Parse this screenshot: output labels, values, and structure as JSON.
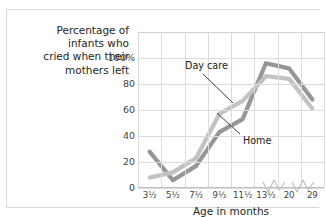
{
  "chart_data": {
    "type": "line",
    "title": "Percentage of infants who cried when their mothers left",
    "title_lines": [
      "Percentage of",
      "infants who",
      "cried when their",
      "mothers left"
    ],
    "xlabel": "Age in months",
    "ylabel": "",
    "categories": [
      "3½",
      "5½",
      "7½",
      "9½",
      "11½",
      "13½",
      "20",
      "29"
    ],
    "ytick_labels": [
      "0",
      "20",
      "40",
      "60",
      "80",
      "100%"
    ],
    "yticks": [
      0,
      20,
      40,
      60,
      80,
      100
    ],
    "ylim": [
      0,
      120
    ],
    "grid": true,
    "legend_position": "inline-annotations",
    "axis_breaks": [
      "after 13½",
      "after 20"
    ],
    "series": [
      {
        "name": "Home",
        "color": "#969696",
        "values": [
          28,
          6,
          17,
          43,
          53,
          96,
          92,
          68
        ]
      },
      {
        "name": "Day care",
        "color": "#c2c2c2",
        "values": [
          8,
          12,
          23,
          57,
          67,
          86,
          84,
          61
        ]
      }
    ],
    "annotations": [
      {
        "label": "Day care",
        "series": "Day care"
      },
      {
        "label": "Home",
        "series": "Home"
      }
    ]
  },
  "colors": {
    "home_line": "#969696",
    "daycare_line": "#c2c2c2",
    "grid": "#dcdcdc",
    "axis": "#bfbfbf",
    "text": "#262626",
    "frame": "#d9d9d9"
  }
}
